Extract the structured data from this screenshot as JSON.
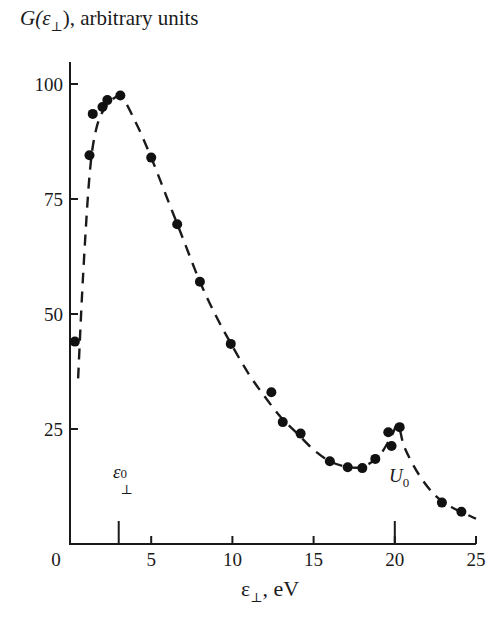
{
  "chart_data": {
    "type": "scatter",
    "title": "",
    "ylabel": "G(ε⊥), arbitrary units",
    "xlabel": "ε⊥, eV",
    "xlim": [
      0,
      25
    ],
    "ylim": [
      0,
      105
    ],
    "x_ticks": [
      0,
      5,
      10,
      15,
      20,
      25
    ],
    "y_ticks": [
      25,
      50,
      75,
      100
    ],
    "grid": false,
    "legend": null,
    "series": [
      {
        "name": "measured",
        "style": "markers",
        "points": [
          [
            0.3,
            44
          ],
          [
            1.2,
            84.5
          ],
          [
            1.4,
            93.5
          ],
          [
            2.0,
            95
          ],
          [
            2.3,
            96.5
          ],
          [
            3.1,
            97.5
          ],
          [
            5.0,
            84
          ],
          [
            6.6,
            69.5
          ],
          [
            8.0,
            57
          ],
          [
            9.9,
            43.5
          ],
          [
            12.4,
            33
          ],
          [
            13.1,
            26.5
          ],
          [
            14.2,
            24
          ],
          [
            16.0,
            18
          ],
          [
            17.1,
            16.7
          ],
          [
            18.0,
            16.5
          ],
          [
            18.8,
            18.5
          ],
          [
            19.6,
            24.3
          ],
          [
            19.8,
            21.3
          ],
          [
            20.3,
            25.4
          ],
          [
            22.9,
            9
          ],
          [
            24.1,
            7
          ]
        ]
      },
      {
        "name": "fit",
        "style": "dashed-line",
        "points": [
          [
            0.5,
            36
          ],
          [
            0.8,
            58
          ],
          [
            1.2,
            80
          ],
          [
            1.6,
            90
          ],
          [
            2.2,
            95
          ],
          [
            3.1,
            97.2
          ],
          [
            4.0,
            92
          ],
          [
            5.0,
            84
          ],
          [
            6.0,
            75
          ],
          [
            7.0,
            66
          ],
          [
            8.0,
            57
          ],
          [
            9.0,
            49.5
          ],
          [
            10.0,
            43
          ],
          [
            11.0,
            37
          ],
          [
            12.0,
            32
          ],
          [
            13.0,
            27.5
          ],
          [
            14.0,
            24
          ],
          [
            15.0,
            20.5
          ],
          [
            16.0,
            18
          ],
          [
            17.0,
            16.8
          ],
          [
            18.0,
            16.8
          ],
          [
            19.0,
            19
          ],
          [
            19.8,
            23.5
          ],
          [
            20.2,
            26
          ],
          [
            20.6,
            21
          ],
          [
            21.5,
            15
          ],
          [
            22.5,
            10.5
          ],
          [
            23.5,
            8
          ],
          [
            25.0,
            5.5
          ]
        ]
      }
    ],
    "annotations": [
      {
        "text": "ε⊥⁰",
        "x": 3.0,
        "marker": "tick"
      },
      {
        "text": "U₀",
        "x": 20.0,
        "marker": "tick"
      }
    ]
  },
  "labels": {
    "y_title_main": "G(ε",
    "y_title_sub": "⊥",
    "y_title_rest": "), arbitrary units",
    "x_title_main": "ε",
    "x_title_sub": "⊥",
    "x_title_rest": ", eV",
    "annot_eps_main": "ε",
    "annot_eps_sub": "⊥",
    "annot_eps_sup": "0",
    "annot_u_main": "U",
    "annot_u_sub": "0"
  },
  "axis": {
    "x_ticks": [
      "0",
      "5",
      "10",
      "15",
      "20",
      "25"
    ],
    "y_ticks": [
      "25",
      "50",
      "75",
      "100"
    ]
  }
}
